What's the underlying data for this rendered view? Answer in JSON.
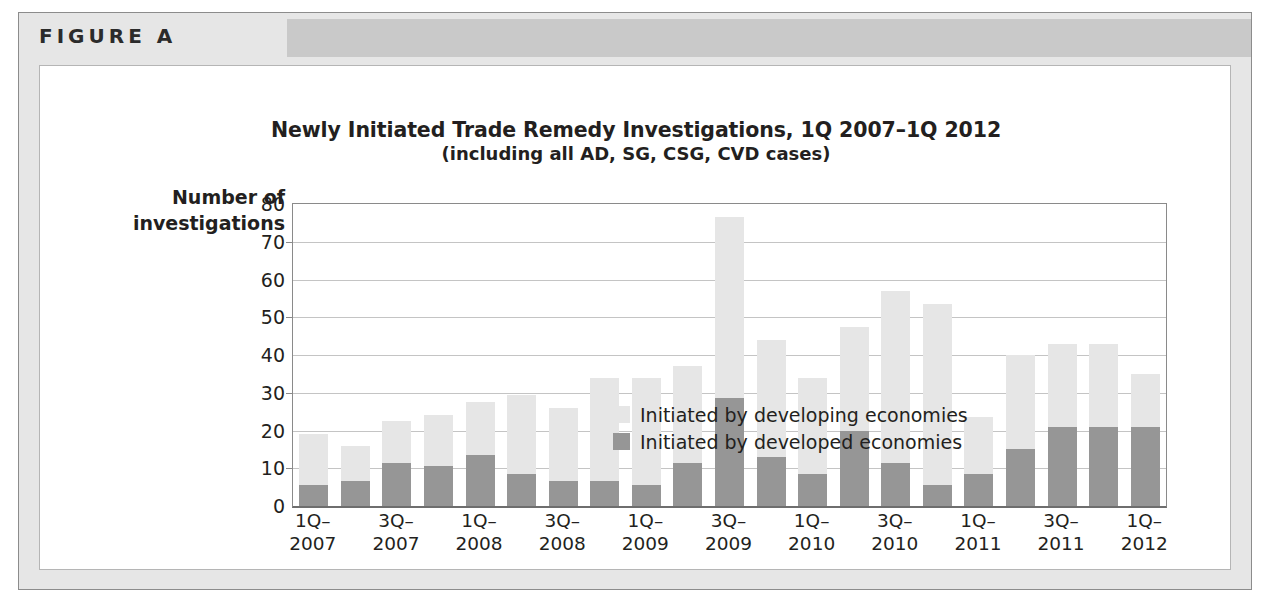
{
  "figure": {
    "label": "FIGURE A"
  },
  "chart_data": {
    "type": "bar",
    "stacked": true,
    "title": "Newly Initiated Trade Remedy Investigations, 1Q 2007–1Q 2012",
    "subtitle": "(including all AD, SG, CSG, CVD cases)",
    "ylabel": "Number of\ninvestigations",
    "ylabel_line1": "Number of",
    "ylabel_line2": "investigations",
    "xlabel": "",
    "ylim": [
      0,
      80
    ],
    "yticks": [
      0,
      10,
      20,
      30,
      40,
      50,
      60,
      70,
      80
    ],
    "ytick_labels": [
      "0",
      "10",
      "20",
      "30",
      "40",
      "50",
      "60",
      "70",
      "80"
    ],
    "grid": true,
    "legend_position": "top-left-inside",
    "categories": [
      "1Q-2007",
      "2Q-2007",
      "3Q-2007",
      "4Q-2007",
      "1Q-2008",
      "2Q-2008",
      "3Q-2008",
      "4Q-2008",
      "1Q-2009",
      "2Q-2009",
      "3Q-2009",
      "4Q-2009",
      "1Q-2010",
      "2Q-2010",
      "3Q-2010",
      "4Q-2010",
      "1Q-2011",
      "2Q-2011",
      "3Q-2011",
      "4Q-2011",
      "1Q-2012"
    ],
    "xtick_labels": [
      {
        "line1": "1Q–",
        "line2": "2007",
        "index": 0
      },
      {
        "line1": "3Q–",
        "line2": "2007",
        "index": 2
      },
      {
        "line1": "1Q–",
        "line2": "2008",
        "index": 4
      },
      {
        "line1": "3Q–",
        "line2": "2008",
        "index": 6
      },
      {
        "line1": "1Q–",
        "line2": "2009",
        "index": 8
      },
      {
        "line1": "3Q–",
        "line2": "2009",
        "index": 10
      },
      {
        "line1": "1Q–",
        "line2": "2010",
        "index": 12
      },
      {
        "line1": "3Q–",
        "line2": "2010",
        "index": 14
      },
      {
        "line1": "1Q–",
        "line2": "2011",
        "index": 16
      },
      {
        "line1": "3Q–",
        "line2": "2011",
        "index": 18
      },
      {
        "line1": "1Q–",
        "line2": "2012",
        "index": 20
      }
    ],
    "series": [
      {
        "name": "Initiated by developed economies",
        "color": "#969696",
        "values": [
          5.5,
          6.5,
          11.5,
          10.5,
          13.5,
          8.5,
          6.5,
          6.5,
          5.5,
          11.5,
          28.5,
          13.0,
          8.5,
          20.0,
          11.5,
          5.5,
          8.5,
          15.0,
          21.0,
          21.0,
          21.0
        ]
      },
      {
        "name": "Initiated by developing economies",
        "color": "#e6e6e6",
        "values": [
          13.5,
          9.5,
          11.0,
          13.5,
          14.0,
          21.0,
          19.5,
          27.5,
          28.5,
          25.5,
          48.0,
          31.0,
          25.5,
          27.5,
          45.5,
          48.0,
          15.0,
          25.0,
          22.0,
          22.0,
          14.0
        ]
      }
    ],
    "totals": [
      19,
      16,
      22.5,
      24,
      27.5,
      29.5,
      26,
      34,
      34,
      37,
      76.5,
      44,
      34,
      47.5,
      57,
      53.5,
      23.5,
      40,
      43,
      43,
      35
    ],
    "legend": [
      {
        "label": "Initiated by developing economies",
        "color": "#e6e6e6"
      },
      {
        "label": "Initiated by developed economies",
        "color": "#969696"
      }
    ]
  }
}
